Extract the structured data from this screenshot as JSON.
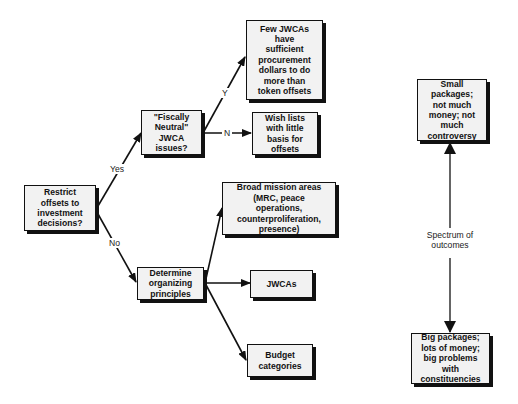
{
  "diagram": {
    "type": "decision-tree",
    "root": {
      "id": "restrict",
      "text": "Restrict\noffsets to\ninvestment\ndecisions?"
    },
    "nodes": [
      {
        "id": "fiscally",
        "text": "\"Fiscally\nNeutral\"\nJWCA\nissues?"
      },
      {
        "id": "few",
        "text": "Few JWCAs\nhave\nsufficient\nprocurement\ndollars to do\nmore than\ntoken offsets"
      },
      {
        "id": "wish",
        "text": "Wish lists\nwith little\nbasis for\noffsets"
      },
      {
        "id": "determine",
        "text": "Determine\norganizing\nprinciples"
      },
      {
        "id": "broad",
        "text": "Broad mission areas\n(MRC, peace\noperations,\ncounterproliferation,\npresence)"
      },
      {
        "id": "jwcas",
        "text": "JWCAs"
      },
      {
        "id": "budget",
        "text": "Budget\ncategories"
      },
      {
        "id": "small",
        "text": "Small\npackages;\nnot much\nmoney; not\nmuch\ncontroversy"
      },
      {
        "id": "big",
        "text": "Big packages;\nlots of money;\nbig problems\nwith\nconstituencies"
      }
    ],
    "edge_labels": {
      "yes": "Yes",
      "no": "No",
      "y": "Y",
      "n": "N",
      "spectrum": "Spectrum of\noutcomes"
    },
    "edges": [
      {
        "from": "restrict",
        "to": "fiscally",
        "label": "Yes"
      },
      {
        "from": "restrict",
        "to": "determine",
        "label": "No"
      },
      {
        "from": "fiscally",
        "to": "few",
        "label": "Y"
      },
      {
        "from": "fiscally",
        "to": "wish",
        "label": "N"
      },
      {
        "from": "determine",
        "to": "broad",
        "label": ""
      },
      {
        "from": "determine",
        "to": "jwcas",
        "label": ""
      },
      {
        "from": "determine",
        "to": "budget",
        "label": ""
      },
      {
        "from": "small",
        "to": "big",
        "label": "Spectrum of outcomes",
        "bidirectional": true
      }
    ],
    "colors": {
      "box_fill": "#f2f2f2",
      "line": "#111111",
      "background": "#ffffff"
    }
  }
}
